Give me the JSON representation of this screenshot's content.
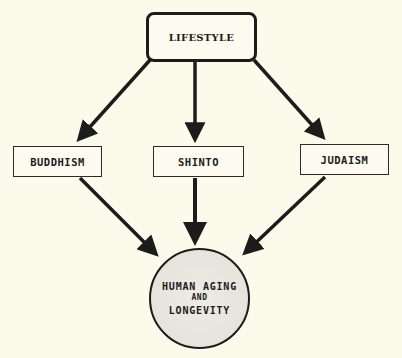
{
  "diagram": {
    "type": "flowchart",
    "colors": {
      "background": "#fcfaea",
      "stroke": "#1c1c1c",
      "outcome_fill": "#e6e4dc"
    },
    "nodes": {
      "lifestyle": {
        "label": "LIFESTYLE",
        "shape": "rounded-rectangle"
      },
      "buddhism": {
        "label": "BUDDHISM",
        "shape": "rectangle"
      },
      "shinto": {
        "label": "SHINTO",
        "shape": "rectangle"
      },
      "judaism": {
        "label": "JUDAISM",
        "shape": "rectangle"
      },
      "outcome": {
        "shape": "circle",
        "line1": "HUMAN AGING",
        "line2": "AND",
        "line3": "LONGEVITY"
      }
    },
    "edges": [
      {
        "from": "LIFESTYLE",
        "to": "BUDDHISM"
      },
      {
        "from": "LIFESTYLE",
        "to": "SHINTO"
      },
      {
        "from": "LIFESTYLE",
        "to": "JUDAISM"
      },
      {
        "from": "BUDDHISM",
        "to": "HUMAN AGING AND LONGEVITY"
      },
      {
        "from": "SHINTO",
        "to": "HUMAN AGING AND LONGEVITY"
      },
      {
        "from": "JUDAISM",
        "to": "HUMAN AGING AND LONGEVITY"
      }
    ]
  }
}
